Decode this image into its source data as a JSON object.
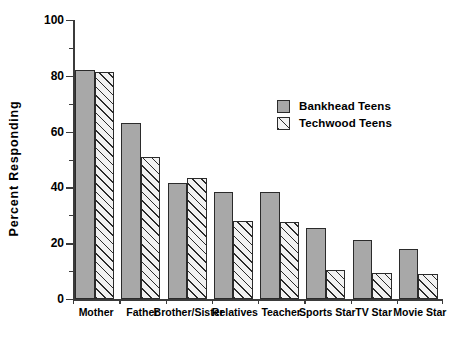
{
  "chart_data": {
    "type": "bar",
    "title": "",
    "xlabel": "",
    "ylabel": "Percent  Responding",
    "ylim": [
      0,
      100
    ],
    "yticks": [
      0,
      20,
      40,
      60,
      80,
      100
    ],
    "ytick_labels": [
      "0",
      "20",
      "40",
      "60",
      "80",
      "100"
    ],
    "yminor_ticks": [
      10,
      30,
      50,
      70,
      90
    ],
    "grid": false,
    "legend_position": "upper right",
    "categories": [
      "Mother",
      "Father",
      "Brother/Sister",
      "Relatives",
      "Teacher",
      "Sports Star",
      "TV Star",
      "Movie Star"
    ],
    "series": [
      {
        "name": "Bankhead Teens",
        "pattern": "solid",
        "color": "#a8a8a8",
        "values": [
          82,
          63,
          41.5,
          38.5,
          38.5,
          25.5,
          21,
          18
        ]
      },
      {
        "name": "Techwood Teens",
        "pattern": "hatch",
        "color": "#f2f2f2",
        "values": [
          81.5,
          51,
          43.5,
          28,
          27.5,
          10.5,
          9.5,
          9
        ]
      }
    ]
  },
  "legend": {
    "entries": [
      {
        "label": "Bankhead Teens"
      },
      {
        "label": "Techwood Teens"
      }
    ]
  },
  "colors": {
    "bar_solid": "#a8a8a8",
    "bar_hatch_bg": "#f2f2f2",
    "outline": "#2b2b2b",
    "axis": "#3b3b3b",
    "background": "#ffffff"
  }
}
